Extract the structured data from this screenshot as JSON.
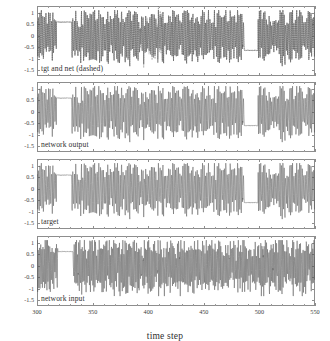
{
  "figure": {
    "width": 330,
    "height": 335,
    "background": "#ffffff",
    "line_color": "#5a5a5a",
    "frame_color": "#8d8d8d",
    "text_color": "#3d3d3d"
  },
  "axes": {
    "xlabel": "time step",
    "xticks": [
      300,
      350,
      400,
      450,
      500,
      550
    ],
    "xticklabels": [
      "300",
      "350",
      "400",
      "450",
      "500",
      "550"
    ],
    "xlim": [
      300,
      550
    ],
    "yticks": [
      1,
      0.5,
      0,
      -0.5,
      -1,
      -1.5
    ],
    "yticklabels": [
      "1",
      "0.5",
      "0",
      "-0.5",
      "-1",
      "-1.5"
    ],
    "ylim": [
      -1.75,
      1.3
    ],
    "grid": false
  },
  "panels": [
    {
      "id": "tgt-and-net",
      "label": "tgt and net (dashed)"
    },
    {
      "id": "network-output",
      "label": "network output"
    },
    {
      "id": "target",
      "label": "target"
    },
    {
      "id": "network-input",
      "label": "network input"
    }
  ],
  "chart_data": {
    "type": "line",
    "title": "",
    "xlabel": "time step",
    "ylabel": "",
    "xlim": [
      300,
      550
    ],
    "ylim": [
      -1.75,
      1.3
    ],
    "xticks": [
      300,
      350,
      400,
      450,
      500,
      550
    ],
    "yticks": [
      1,
      0.5,
      0,
      -0.5,
      -1,
      -1.5
    ],
    "grid": false,
    "legend": "none",
    "subplots": [
      {
        "name": "tgt and net (dashed)",
        "annotation": "tgt and net (dashed)",
        "series": [
          {
            "name": "target",
            "style": "solid",
            "description": "Oscillatory signal, amplitude roughly -1.3 to 1.1, dense alternating spikes across time steps 300-550 with quiet plateaus near 0.6 around t=318-330 and near -0.65 around t=488-497.",
            "x": [
              300,
              550
            ],
            "y_range": [
              -1.35,
              1.15
            ]
          },
          {
            "name": "net",
            "style": "dashed",
            "description": "Dashed network trace overlaying target; nearly coincident except a dense dashed burst around t=395-410.",
            "x": [
              300,
              550
            ],
            "y_range": [
              -1.35,
              1.15
            ]
          }
        ]
      },
      {
        "name": "network output",
        "annotation": "network output",
        "series": [
          {
            "name": "network output",
            "style": "solid",
            "description": "Same oscillatory waveform as target; amplitude roughly -1.3 to 1.1 with plateaus near 0.6 at t=318-330 and near -0.6 at t=488-497.",
            "x": [
              300,
              550
            ],
            "y_range": [
              -1.3,
              1.1
            ]
          }
        ]
      },
      {
        "name": "target",
        "annotation": "target",
        "series": [
          {
            "name": "target",
            "style": "solid",
            "description": "Reference oscillatory waveform; amplitude roughly -1.25 to 1.1 with plateaus near 0.6 at t=318-330 and near -0.6 at t=488-497.",
            "x": [
              300,
              550
            ],
            "y_range": [
              -1.25,
              1.1
            ]
          }
        ]
      },
      {
        "name": "network input",
        "annotation": "network input",
        "series": [
          {
            "name": "network input",
            "style": "solid",
            "description": "Noisier driving signal; amplitude roughly -1.2 to 1.05, high-frequency fluctuation throughout with a smoother segment near t=320-333.",
            "x": [
              300,
              550
            ],
            "y_range": [
              -1.2,
              1.05
            ]
          }
        ]
      }
    ]
  }
}
